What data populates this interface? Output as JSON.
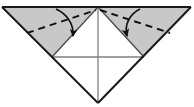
{
  "figure": {
    "kind": "instructional-line-drawing",
    "canvas": {
      "width": 194,
      "height": 107
    },
    "background_color": "#ffffff"
  },
  "colors": {
    "shaded_fill": "#c8c8c8",
    "shaded_fill_alt": "#c4c4c4",
    "paper_white": "#ffffff",
    "outline": "#1a1a1a",
    "inner_crease": "#808080",
    "dashed_fold": "#111111",
    "arrow": "#111111"
  },
  "geometry": {
    "top_left_corner": {
      "x": 2,
      "y": 7
    },
    "top_right_corner": {
      "x": 191,
      "y": 7
    },
    "top_apex": {
      "x": 98,
      "y": 7
    },
    "bottom_apex": {
      "x": 98,
      "y": 103
    },
    "mid_left": {
      "x": 52,
      "y": 57
    },
    "mid_right": {
      "x": 144,
      "y": 57
    },
    "center": {
      "x": 98,
      "y": 57
    }
  },
  "shapes": {
    "outer_triangle": {
      "name": "large-inverted-triangle",
      "points": "2,7 191,7 98,103",
      "fill": "#ffffff",
      "stroke": "#1a1a1a"
    },
    "left_flap": {
      "name": "left-shaded-flap",
      "points": "2,7 98,7 52,57",
      "fill": "#c8c8c8"
    },
    "right_flap": {
      "name": "right-shaded-flap",
      "points": "98,7 191,7 144,57",
      "fill": "#c8c8c8"
    },
    "center_upper_triangle": {
      "name": "center-upper-white-triangle",
      "points": "52,57 144,57 98,7",
      "fill": "#ffffff"
    },
    "center_lower_triangle": {
      "name": "center-lower-white-triangle",
      "points": "52,57 144,57 98,103",
      "fill": "#ffffff"
    }
  },
  "creases": [
    {
      "name": "top-edge-crease",
      "x1": 2,
      "y1": 7,
      "x2": 191,
      "y2": 7,
      "style": "solid",
      "color": "#1a1a1a"
    },
    {
      "name": "left-outer-edge",
      "x1": 2,
      "y1": 7,
      "x2": 98,
      "y2": 103,
      "style": "solid",
      "color": "#1a1a1a"
    },
    {
      "name": "right-outer-edge",
      "x1": 191,
      "y1": 7,
      "x2": 98,
      "y2": 103,
      "style": "solid",
      "color": "#1a1a1a"
    },
    {
      "name": "horizontal-middle-crease",
      "x1": 52,
      "y1": 57,
      "x2": 144,
      "y2": 57,
      "style": "solid",
      "color": "#808080"
    },
    {
      "name": "vertical-center-crease",
      "x1": 98,
      "y1": 7,
      "x2": 98,
      "y2": 103,
      "style": "solid",
      "color": "#808080"
    },
    {
      "name": "left-diagonal-crease",
      "x1": 52,
      "y1": 57,
      "x2": 98,
      "y2": 7,
      "style": "solid",
      "color": "#4d4d4d"
    },
    {
      "name": "right-diagonal-crease",
      "x1": 144,
      "y1": 57,
      "x2": 98,
      "y2": 7,
      "style": "solid",
      "color": "#4d4d4d"
    }
  ],
  "fold_lines": [
    {
      "name": "left-valley-fold-dashed",
      "x1": 27,
      "y1": 33,
      "x2": 96,
      "y2": 10,
      "style": "dashed",
      "dash_pattern": "7,5",
      "color": "#111111"
    },
    {
      "name": "right-valley-fold-dashed",
      "x1": 100,
      "y1": 10,
      "x2": 170,
      "y2": 33,
      "style": "dashed",
      "dash_pattern": "7,5",
      "color": "#111111"
    }
  ],
  "arrows": [
    {
      "name": "left-fold-arrow",
      "path": "M 56,9 C 67,14 74,24 73,36",
      "head_at": {
        "x": 73,
        "y": 39
      },
      "head_angle_deg": 98,
      "direction": "fold left flap inward and down",
      "color": "#111111"
    },
    {
      "name": "right-fold-arrow",
      "path": "M 140,9 C 130,14 124,24 127,36",
      "head_at": {
        "x": 128,
        "y": 39
      },
      "head_angle_deg": 82,
      "direction": "fold right flap inward and down",
      "color": "#111111"
    }
  ],
  "labels": {
    "step_label": "",
    "notes": ""
  },
  "accessibility": {
    "alt_text": "Inverted triangle of folded paper with two shaded upper flaps; dashed valley-fold lines and curved arrows show each shaded flap folding down toward the center."
  }
}
